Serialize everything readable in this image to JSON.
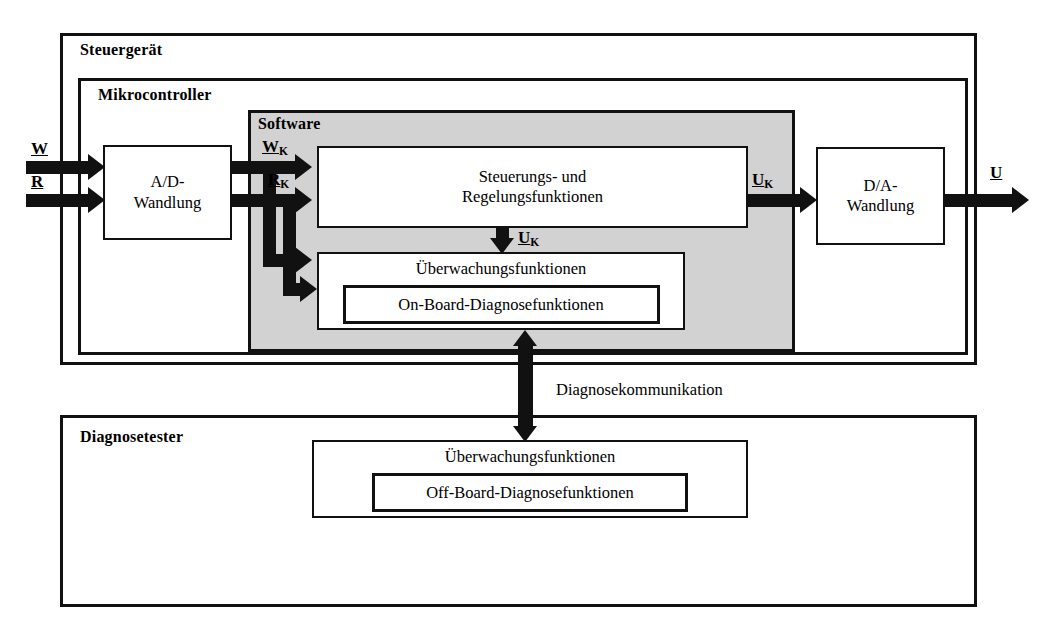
{
  "diagram": {
    "containers": {
      "ecu_label": "Steuergerät",
      "mcu_label": "Mikrocontroller",
      "software_label": "Software",
      "tester_label": "Diagnosetester"
    },
    "blocks": {
      "ad_conversion": "A/D-\nWandlung",
      "da_conversion": "D/A-\nWandlung",
      "control_functions": "Steuerungs- und\nRegelungsfunktionen",
      "monitoring_onboard": "Überwachungsfunktionen",
      "onboard_diagnosis": "On-Board-Diagnosefunktionen",
      "monitoring_offboard": "Überwachungsfunktionen",
      "offboard_diagnosis": "Off-Board-Diagnosefunktionen"
    },
    "signals": {
      "w": "W",
      "r": "R",
      "w_k_base": "W",
      "w_k_sub": "K",
      "r_k_base": "R",
      "r_k_sub": "K",
      "u_k_base": "U",
      "u_k_sub": "K",
      "u_k2_base": "U",
      "u_k2_sub": "K",
      "u_k3_base": "U",
      "u_k3_sub": "K",
      "u_out": "U"
    },
    "connections": {
      "diagnosis_communication": "Diagnosekommunikation"
    },
    "colors": {
      "software_fill": "#d2d2d2",
      "block_fill": "#ffffff",
      "line": "#111111",
      "page_background": "#ffffff"
    }
  }
}
